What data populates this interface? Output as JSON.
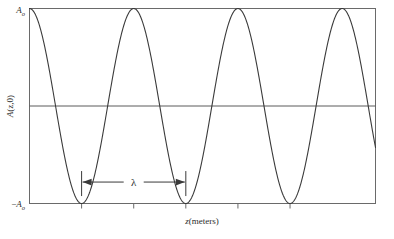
{
  "chart_data": {
    "type": "line",
    "title": "",
    "subtitle": "",
    "xlabel": "z(meters)",
    "ylabel": "A(z,0)",
    "grid": false,
    "legend": null,
    "legend_position": "none",
    "xlim": [
      0,
      3.32
    ],
    "ylim": [
      -1,
      1
    ],
    "y_tick_labels": [
      "Aₒ",
      "−Aₒ"
    ],
    "y_tick_values": [
      1,
      -1
    ],
    "y_axis_top_label": "Aₒ",
    "y_axis_bottom_label": "−Aₒ",
    "x_tick_labels": [
      "",
      "",
      "",
      "",
      ""
    ],
    "x_tick_values": [
      0.5,
      1.0,
      1.5,
      2.0,
      2.5
    ],
    "zero_line": 0,
    "series": [
      {
        "name": "A(z,0)",
        "type": "cosine",
        "amplitude": 1,
        "wavelength": 1.0,
        "phase": 0,
        "color": "#3a3a3a",
        "description": "cosine wave starting at maximum amplitude at z=0"
      }
    ],
    "annotations": [
      {
        "name": "wavelength-annotation",
        "label": "λ",
        "type": "double-arrow",
        "from_x": 0.5,
        "to_x": 1.5,
        "at_y": -0.78
      }
    ]
  },
  "labels": {
    "y_top": "A",
    "y_top_sub": "o",
    "y_bottom_sign": "−",
    "y_bottom": "A",
    "y_bottom_sub": "o",
    "y_axis_var": "A",
    "y_axis_args": "(z,0)",
    "x_axis_var": "z",
    "x_axis_unit": "(meters)",
    "lambda_symbol": "λ"
  },
  "colors": {
    "curve": "#3a3a3a",
    "axis": "#5a5a5a",
    "frame": "#6a6a6a",
    "text": "#2b2b2b",
    "background": "#ffffff",
    "annotation": "#3a3a3a"
  }
}
